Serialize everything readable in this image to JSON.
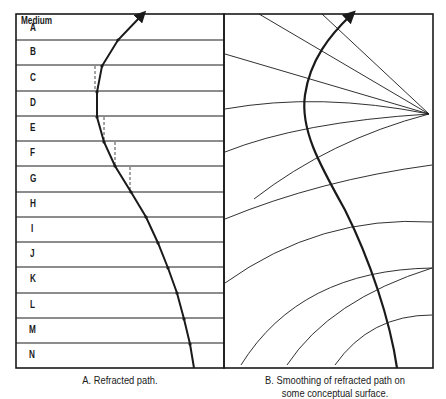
{
  "panel_a": {
    "header": "Medium",
    "media": [
      "A",
      "B",
      "C",
      "D",
      "E",
      "F",
      "G",
      "H",
      "I",
      "J",
      "K",
      "L",
      "M",
      "N"
    ],
    "caption": "A. Refracted path."
  },
  "panel_b": {
    "caption_line1": "B. Smoothing of refracted path on",
    "caption_line2": "some conceptual surface."
  },
  "colors": {
    "line": "#1a1a1a",
    "background": "#ffffff"
  }
}
